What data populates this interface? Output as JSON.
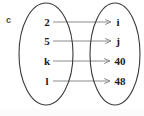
{
  "figure": {
    "label": "c",
    "type": "mapping-diagram",
    "background_color": "#ffffff",
    "outline_color": "#3a3a3a",
    "arrow_color": "#8c8c8c",
    "text_color": "#1a1a1a"
  },
  "sets": {
    "domain": {
      "name": "left-set",
      "center_x": 46,
      "center_y": 54,
      "radius_x": 27,
      "radius_y": 51,
      "elements": [
        {
          "label": "2",
          "x": 47,
          "y": 22
        },
        {
          "label": "5",
          "x": 47,
          "y": 41
        },
        {
          "label": "k",
          "x": 47,
          "y": 61
        },
        {
          "label": "l",
          "x": 47,
          "y": 81
        }
      ]
    },
    "codomain": {
      "name": "right-set",
      "center_x": 115,
      "center_y": 54,
      "radius_x": 25,
      "radius_y": 51,
      "elements": [
        {
          "label": "i",
          "x": 118,
          "y": 22
        },
        {
          "label": "j",
          "x": 118,
          "y": 41
        },
        {
          "label": "40",
          "x": 120,
          "y": 61
        },
        {
          "label": "48",
          "x": 120,
          "y": 81
        }
      ]
    }
  },
  "mappings": [
    {
      "from": "2",
      "to": "i",
      "x1": 53,
      "y1": 22,
      "x2": 111,
      "y2": 22
    },
    {
      "from": "5",
      "to": "j",
      "x1": 53,
      "y1": 41,
      "x2": 111,
      "y2": 41
    },
    {
      "from": "k",
      "to": "40",
      "x1": 53,
      "y1": 61,
      "x2": 110,
      "y2": 61
    },
    {
      "from": "l",
      "to": "48",
      "x1": 53,
      "y1": 81,
      "x2": 110,
      "y2": 81
    }
  ]
}
